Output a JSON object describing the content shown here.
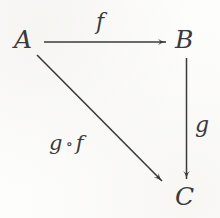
{
  "diagram": {
    "kind": "commutative-triangle",
    "background_color": "#fdfdfc",
    "ink_color": "#3a3a3c",
    "objects": [
      {
        "id": "A",
        "label": "A",
        "x": 25,
        "y": 40
      },
      {
        "id": "B",
        "label": "B",
        "x": 186,
        "y": 40
      },
      {
        "id": "C",
        "label": "C",
        "x": 187,
        "y": 197
      }
    ],
    "morphisms": [
      {
        "id": "f",
        "label": "f",
        "from": "A",
        "to": "B",
        "orientation": "horizontal",
        "start": [
          44,
          42
        ],
        "end": [
          167,
          42
        ],
        "label_x": 104,
        "label_y": 23
      },
      {
        "id": "g",
        "label": "g",
        "from": "B",
        "to": "C",
        "orientation": "vertical",
        "start": [
          187,
          58
        ],
        "end": [
          187,
          180
        ],
        "label_x": 201,
        "label_y": 128
      },
      {
        "id": "gof",
        "label_g": "g",
        "label_ring": "∘",
        "label_f": "f",
        "from": "A",
        "to": "C",
        "orientation": "diagonal",
        "start": [
          37,
          55
        ],
        "end": [
          163,
          182
        ],
        "label_x": 80,
        "label_y": 150
      }
    ]
  }
}
